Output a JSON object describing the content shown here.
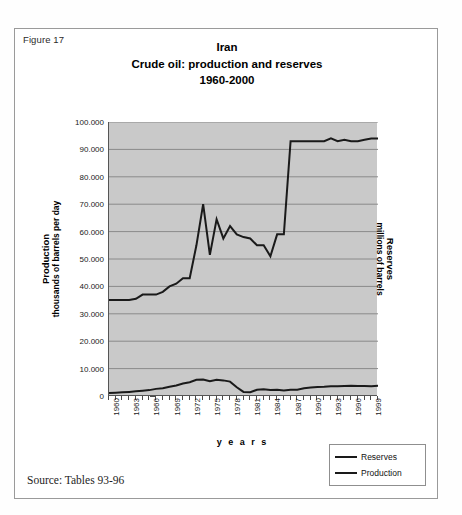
{
  "figure": {
    "label": "Figure 17",
    "source": "Source: Tables 93-96"
  },
  "chart_data": {
    "type": "line",
    "title": "Iran\nCrude oil: production and reserves\n1960-2000",
    "title_lines": [
      "Iran",
      "Crude oil: production and reserves",
      "1960-2000"
    ],
    "xlabel": "y e a r s",
    "ylabel_left_main": "Production",
    "ylabel_left_sub": "thousands of barrels per day",
    "ylabel_right_main": "Reserves",
    "ylabel_right_sub": "millions of barrels",
    "ylim": [
      0,
      100000
    ],
    "ytick_labels": [
      "100.000",
      "90.000",
      "80.000",
      "70.000",
      "60.000",
      "50.000",
      "40.000",
      "30.000",
      "20.000",
      "10.000",
      "0"
    ],
    "ytick_values": [
      100000,
      90000,
      80000,
      70000,
      60000,
      50000,
      40000,
      30000,
      20000,
      10000,
      0
    ],
    "grid": true,
    "grid_color": "#8a8a8a",
    "plot_bg": "#c9c9c9",
    "line_color": "#1a1a1a",
    "legend_position": "bottom-right",
    "xlim": [
      1960,
      2000
    ],
    "x": [
      1960,
      1961,
      1962,
      1963,
      1964,
      1965,
      1966,
      1967,
      1968,
      1969,
      1970,
      1971,
      1972,
      1973,
      1974,
      1975,
      1976,
      1977,
      1978,
      1979,
      1980,
      1981,
      1982,
      1983,
      1984,
      1985,
      1986,
      1987,
      1988,
      1989,
      1990,
      1991,
      1992,
      1993,
      1994,
      1995,
      1996,
      1997,
      1998,
      1999,
      2000
    ],
    "xtick_labels": [
      "1960",
      "1963",
      "1966",
      "1969",
      "1972",
      "1975",
      "1978",
      "1981",
      "1984",
      "1987",
      "1990",
      "1993",
      "1996",
      "1999"
    ],
    "xtick_values": [
      1960,
      1963,
      1966,
      1969,
      1972,
      1975,
      1978,
      1981,
      1984,
      1987,
      1990,
      1993,
      1996,
      1999
    ],
    "series": [
      {
        "name": "Reserves",
        "unit": "millions of barrels",
        "values": [
          35000,
          35000,
          35000,
          35000,
          35500,
          37000,
          37000,
          37000,
          38000,
          40000,
          41000,
          43000,
          43000,
          55000,
          70000,
          51500,
          64500,
          57500,
          62000,
          59000,
          58000,
          57500,
          55000,
          55000,
          51000,
          59000,
          59000,
          93000,
          93000,
          93000,
          93000,
          93000,
          93000,
          94000,
          93000,
          93500,
          93000,
          93000,
          93500,
          94000,
          94000
        ]
      },
      {
        "name": "Production",
        "unit": "thousands of barrels per day",
        "values": [
          1100,
          1200,
          1350,
          1500,
          1700,
          1900,
          2150,
          2600,
          2850,
          3400,
          3850,
          4550,
          5050,
          5900,
          6050,
          5400,
          5900,
          5700,
          5250,
          3200,
          1500,
          1400,
          2250,
          2450,
          2200,
          2250,
          2000,
          2300,
          2250,
          2800,
          3100,
          3300,
          3400,
          3600,
          3600,
          3650,
          3700,
          3650,
          3650,
          3600,
          3700
        ]
      }
    ]
  },
  "legend": {
    "items": [
      {
        "label": "Reserves"
      },
      {
        "label": "Production"
      }
    ]
  }
}
